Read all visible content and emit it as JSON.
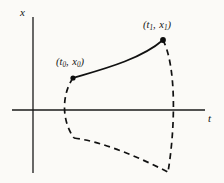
{
  "figure": {
    "background_color": "#fbfaf7",
    "ink_color": "#111111",
    "axes": {
      "x_axis_label": "x",
      "t_axis_label": "t",
      "origin": {
        "px": 33,
        "py": 110
      },
      "horizontal_axis": {
        "x_start": 12,
        "x_end": 205,
        "y": 110
      },
      "vertical_axis": {
        "y_start": 17,
        "y_end": 173,
        "x": 33
      }
    },
    "labels": {
      "start_point": {
        "open_paren": "(",
        "t_symbol": "t",
        "t_subscript": "0",
        "comma": ", ",
        "x_symbol": "x",
        "x_subscript": "0",
        "close_paren": ")",
        "full_text": "(t0, x0)"
      },
      "end_point": {
        "open_paren": "(",
        "t_symbol": "t",
        "t_subscript": "1",
        "comma": ", ",
        "x_symbol": "x",
        "x_subscript": "1",
        "close_paren": ")",
        "full_text": "(t1, x1)"
      }
    }
  },
  "chart_data": {
    "type": "line",
    "title": "",
    "xlabel": "t",
    "ylabel": "x",
    "grid": false,
    "legend": "none",
    "axis_origin_px": [
      33,
      110
    ],
    "series": [
      {
        "name": "optimal-trajectory",
        "style": "solid",
        "marked_endpoints": true,
        "points_px": [
          [
            73,
            78
          ],
          [
            95,
            69
          ],
          [
            120,
            59
          ],
          [
            142,
            49
          ],
          [
            163,
            40
          ]
        ],
        "path": "M 73 78 C 100 70, 140 60, 163 40"
      },
      {
        "name": "left-boundary-arc",
        "style": "dashed",
        "points_px": [
          [
            73,
            78
          ],
          [
            64,
            95
          ],
          [
            63,
            118
          ],
          [
            74,
            138
          ]
        ],
        "path": "M 73 78 C 62 94, 61 120, 74 138"
      },
      {
        "name": "bottom-boundary-arc",
        "style": "dashed",
        "points_px": [
          [
            74,
            138
          ],
          [
            100,
            141
          ],
          [
            130,
            155
          ],
          [
            168,
            172
          ]
        ],
        "path": "M 74 138 C 104 142, 138 157, 168 172"
      },
      {
        "name": "right-boundary-arc",
        "style": "dashed",
        "points_px": [
          [
            163,
            40
          ],
          [
            174,
            70
          ],
          [
            172,
            110
          ],
          [
            168,
            172
          ]
        ],
        "path": "M 163 40 C 177 68, 175 130, 168 172"
      }
    ],
    "markers": [
      {
        "name": "start-point",
        "label": "(t0, x0)",
        "px": 73,
        "py": 78
      },
      {
        "name": "end-point",
        "label": "(t1, x1)",
        "px": 163,
        "py": 40
      }
    ],
    "annotations": [
      {
        "name": "x-axis-label",
        "text": "x",
        "px": 24,
        "py": 13
      },
      {
        "name": "t-axis-label",
        "text": "t",
        "px": 212,
        "py": 118
      },
      {
        "name": "start-point-label",
        "text": "(t0, x0)",
        "px": 80,
        "py": 62
      },
      {
        "name": "end-point-label",
        "text": "(t1, x1)",
        "px": 167,
        "py": 25
      }
    ]
  }
}
